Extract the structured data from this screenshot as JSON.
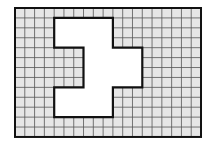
{
  "diagram": {
    "type": "grid-figure",
    "grid": {
      "columns": 19,
      "rows": 13,
      "origin_px": [
        15,
        8
      ],
      "cell_w_px": 9.79,
      "cell_h_px": 9.92,
      "fill_color": "#e6e6e6",
      "line_color": "#555555",
      "border_color": "#111111"
    },
    "shape": {
      "description": "white polygon outlined in black on shaded grid",
      "fill_color": "#ffffff",
      "stroke_color": "#111111",
      "vertices_cells": [
        [
          4,
          1
        ],
        [
          10,
          1
        ],
        [
          10,
          4
        ],
        [
          13,
          4
        ],
        [
          13,
          8
        ],
        [
          10,
          8
        ],
        [
          10,
          11
        ],
        [
          4,
          11
        ],
        [
          4,
          8
        ],
        [
          7,
          8
        ],
        [
          7,
          4
        ],
        [
          4,
          4
        ]
      ]
    }
  }
}
